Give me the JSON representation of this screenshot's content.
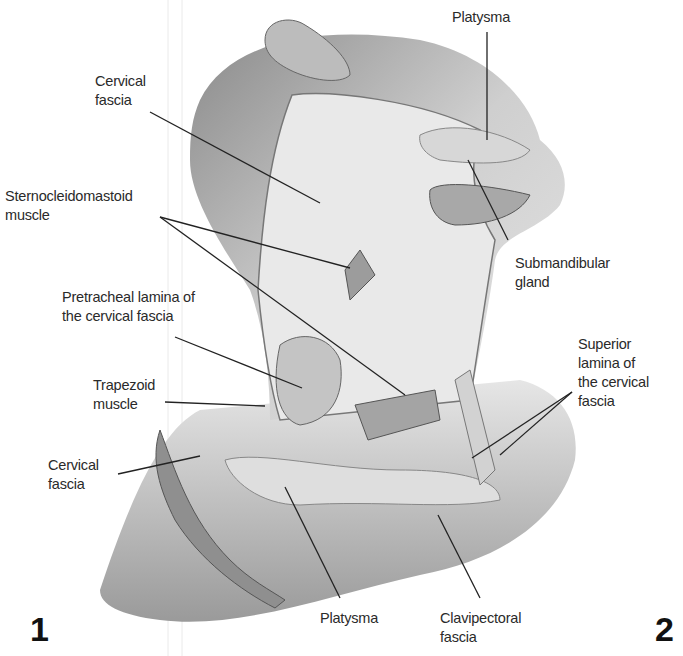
{
  "figure": {
    "panel_numbers": [
      "1",
      "2"
    ]
  },
  "labels": [
    {
      "id": "cervical-fascia-top",
      "text": "Cervical\nfascia",
      "x": 95,
      "y": 72,
      "pointer": [
        [
          150,
          112
        ],
        [
          320,
          203
        ]
      ]
    },
    {
      "id": "sternocleidomastoid",
      "text": "Sternocleidomastoid\nmuscle",
      "x": 5,
      "y": 187,
      "pointer": [
        [
          160,
          217
        ],
        [
          350,
          268
        ]
      ],
      "pointer2": [
        [
          160,
          217
        ],
        [
          405,
          395
        ]
      ]
    },
    {
      "id": "pretracheal-lamina",
      "text": "Pretracheal lamina of\nthe cervical fascia",
      "x": 62,
      "y": 288,
      "pointer": [
        [
          175,
          337
        ],
        [
          302,
          388
        ]
      ]
    },
    {
      "id": "trapezoid",
      "text": "Trapezoid\nmuscle",
      "x": 93,
      "y": 376,
      "pointer": [
        [
          165,
          402
        ],
        [
          265,
          406
        ]
      ]
    },
    {
      "id": "cervical-fascia-bottom",
      "text": "Cervical\nfascia",
      "x": 48,
      "y": 456,
      "pointer": [
        [
          118,
          474
        ],
        [
          200,
          456
        ]
      ]
    },
    {
      "id": "platysma-top",
      "text": "Platysma",
      "x": 452,
      "y": 8,
      "pointer": [
        [
          487,
          32
        ],
        [
          487,
          140
        ]
      ]
    },
    {
      "id": "submandibular",
      "text": "Submandibular\ngland",
      "x": 515,
      "y": 254,
      "pointer": [
        [
          468,
          160
        ],
        [
          508,
          240
        ]
      ]
    },
    {
      "id": "superior-lamina",
      "text": "Superior\nlamina of\nthe cervical\nfascia",
      "x": 578,
      "y": 335,
      "pointer": [
        [
          572,
          392
        ],
        [
          472,
          458
        ]
      ],
      "pointer2": [
        [
          572,
          392
        ],
        [
          500,
          455
        ]
      ]
    },
    {
      "id": "platysma-bottom",
      "text": "Platysma",
      "x": 320,
      "y": 609,
      "pointer": [
        [
          340,
          598
        ],
        [
          285,
          487
        ]
      ]
    },
    {
      "id": "clavipectoral",
      "text": "Clavipectoral\nfascia",
      "x": 440,
      "y": 609,
      "pointer": [
        [
          480,
          598
        ],
        [
          438,
          515
        ]
      ]
    }
  ],
  "colors": {
    "background": "#ffffff",
    "text": "#2a2a2a",
    "skin_light": "#e8e8e8",
    "skin_mid": "#bdbdbd",
    "skin_dark": "#8a8a8a",
    "pointer": "#222222"
  }
}
